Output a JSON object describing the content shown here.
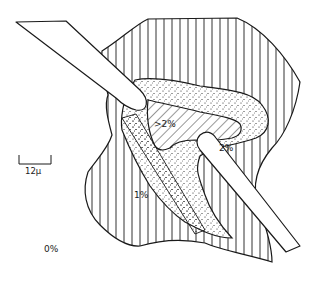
{
  "figure": {
    "regions": [
      {
        "id": "zone-gt2",
        "label": ">2%",
        "pattern": "diagonal-hatch"
      },
      {
        "id": "zone-2",
        "label": "2%",
        "pattern": "stipple"
      },
      {
        "id": "zone-1",
        "label": "1%",
        "pattern": "vertical-lines"
      },
      {
        "id": "zone-0",
        "label": "0%",
        "pattern": "none"
      }
    ],
    "scale_bar": {
      "label": "12μ"
    },
    "instruments": [
      {
        "id": "upper-probe",
        "shape": "rounded-rod"
      },
      {
        "id": "lower-needle",
        "shape": "tapered-rod"
      }
    ],
    "colors": {
      "ink": "#1a1a1a",
      "background": "#ffffff"
    }
  }
}
